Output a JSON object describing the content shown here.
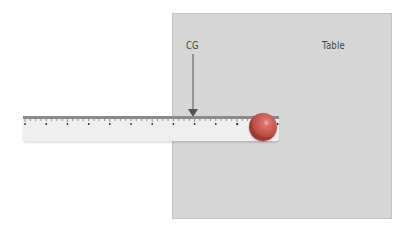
{
  "diagram": {
    "table_label": "Table",
    "cg_label": "CG",
    "colors": {
      "table": "#d6d6d6",
      "ruler": "#efefef",
      "ball": "#cc6057",
      "arrow": "#555555",
      "text": "#444444"
    },
    "ruler": {
      "major_ticks": 12
    }
  }
}
